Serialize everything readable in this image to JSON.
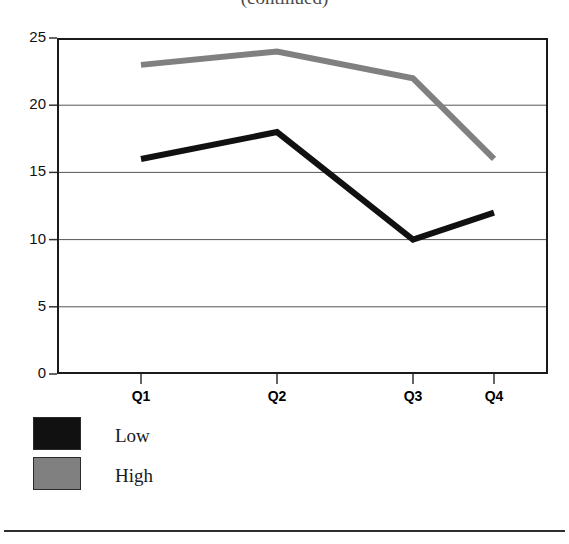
{
  "chart_data": {
    "type": "line",
    "title": "(continued)",
    "title_visibility": "cropped-at-top-edge",
    "xlabel": "",
    "ylabel": "",
    "categories": [
      "Q1",
      "Q2",
      "Q3",
      "Q4"
    ],
    "series": [
      {
        "name": "Low",
        "color": "#111111",
        "values": [
          16,
          18,
          10,
          12
        ]
      },
      {
        "name": "High",
        "color": "#808080",
        "values": [
          23,
          24,
          22,
          16
        ]
      }
    ],
    "ylim": [
      0,
      25
    ],
    "ytick_labels": [
      "0",
      "5",
      "10",
      "15",
      "20",
      "25"
    ],
    "ytick_values": [
      0,
      5,
      10,
      15,
      20,
      25
    ],
    "grid": true,
    "grid_axis": "y",
    "legend_position": "below-left",
    "frame": true
  },
  "legend": {
    "items": [
      {
        "label": "Low",
        "color": "#111111"
      },
      {
        "label": "High",
        "color": "#808080"
      }
    ]
  },
  "colors": {
    "low": "#111111",
    "high": "#808080",
    "frame": "#1a1a1a",
    "grid": "#555555",
    "background": "#ffffff"
  }
}
